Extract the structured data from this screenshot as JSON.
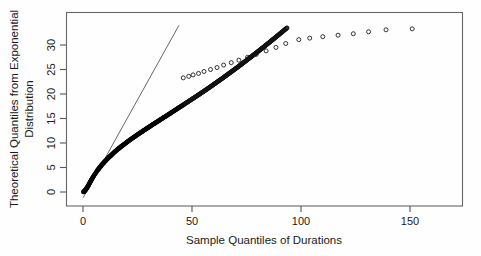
{
  "chart_data": {
    "type": "scatter",
    "title": "",
    "xlabel": "Sample Quantiles of Durations",
    "ylabel": "Theoretical Quantiles from Exponential Distribution",
    "ylabel_line1": "Theoretical Quantiles from Exponential",
    "ylabel_line2": "Distribution",
    "xlim": [
      -4,
      176
    ],
    "ylim": [
      -1.2,
      34
    ],
    "xticks": [
      0,
      50,
      100,
      150
    ],
    "yticks": [
      0,
      5,
      10,
      15,
      20,
      25,
      30
    ],
    "xtick_labels": [
      "0",
      "50",
      "100",
      "150"
    ],
    "ytick_labels": [
      "0",
      "5",
      "10",
      "15",
      "20",
      "25",
      "30"
    ],
    "grid": false,
    "legend": null,
    "point_marker": "open-circle",
    "point_color": "#111111",
    "frame_color": "#666666",
    "reference_line": {
      "label": "theoretical-exponential-reference-line",
      "color": "#555555",
      "x0": 0.0,
      "y0": -1.2,
      "x1": 44.0,
      "y1": 34.0,
      "slope": 0.8,
      "intercept": -1.2
    },
    "series": [
      {
        "name": "Sample vs theoretical exponential quantiles",
        "points": [
          [
            0.2,
            0.02
          ],
          [
            0.3,
            0.05
          ],
          [
            0.4,
            0.08
          ],
          [
            0.5,
            0.12
          ],
          [
            0.6,
            0.16
          ],
          [
            0.7,
            0.2
          ],
          [
            0.8,
            0.25
          ],
          [
            0.9,
            0.3
          ],
          [
            1.0,
            0.35
          ],
          [
            1.1,
            0.4
          ],
          [
            1.2,
            0.46
          ],
          [
            1.3,
            0.52
          ],
          [
            1.4,
            0.58
          ],
          [
            1.5,
            0.64
          ],
          [
            1.6,
            0.7
          ],
          [
            1.7,
            0.77
          ],
          [
            1.8,
            0.84
          ],
          [
            1.9,
            0.91
          ],
          [
            2.0,
            0.98
          ],
          [
            2.1,
            1.05
          ],
          [
            2.2,
            1.13
          ],
          [
            2.3,
            1.2
          ],
          [
            2.4,
            1.28
          ],
          [
            2.5,
            1.36
          ],
          [
            2.6,
            1.45
          ],
          [
            2.7,
            1.53
          ],
          [
            2.8,
            1.62
          ],
          [
            2.9,
            1.7
          ],
          [
            3.0,
            1.79
          ],
          [
            3.1,
            1.88
          ],
          [
            3.2,
            1.98
          ],
          [
            3.4,
            2.07
          ],
          [
            3.5,
            2.17
          ],
          [
            3.6,
            2.27
          ],
          [
            3.7,
            2.37
          ],
          [
            3.9,
            2.47
          ],
          [
            4.0,
            2.58
          ],
          [
            4.1,
            2.68
          ],
          [
            4.3,
            2.79
          ],
          [
            4.4,
            2.9
          ],
          [
            4.6,
            3.02
          ],
          [
            4.7,
            3.13
          ],
          [
            4.9,
            3.25
          ],
          [
            5.0,
            3.37
          ],
          [
            5.2,
            3.49
          ],
          [
            5.4,
            3.62
          ],
          [
            5.6,
            3.74
          ],
          [
            5.8,
            3.87
          ],
          [
            6.0,
            4.0
          ],
          [
            6.2,
            4.14
          ],
          [
            6.4,
            4.27
          ],
          [
            6.6,
            4.41
          ],
          [
            6.9,
            4.55
          ],
          [
            7.1,
            4.7
          ],
          [
            7.4,
            4.84
          ],
          [
            7.6,
            4.99
          ],
          [
            7.9,
            5.15
          ],
          [
            8.2,
            5.3
          ],
          [
            8.5,
            5.46
          ],
          [
            8.8,
            5.62
          ],
          [
            9.1,
            5.79
          ],
          [
            9.5,
            5.96
          ],
          [
            9.8,
            6.13
          ],
          [
            10.2,
            6.31
          ],
          [
            10.6,
            6.49
          ],
          [
            11.0,
            6.67
          ],
          [
            11.4,
            6.86
          ],
          [
            11.8,
            7.05
          ],
          [
            12.3,
            7.25
          ],
          [
            12.8,
            7.45
          ],
          [
            13.3,
            7.66
          ],
          [
            13.8,
            7.87
          ],
          [
            14.3,
            8.09
          ],
          [
            14.9,
            8.31
          ],
          [
            15.5,
            8.54
          ],
          [
            16.1,
            8.78
          ],
          [
            16.8,
            9.02
          ],
          [
            17.5,
            9.27
          ],
          [
            18.2,
            9.52
          ],
          [
            19.0,
            9.78
          ],
          [
            19.8,
            10.05
          ],
          [
            20.6,
            10.33
          ],
          [
            21.5,
            10.61
          ],
          [
            22.4,
            10.91
          ],
          [
            23.4,
            11.21
          ],
          [
            24.4,
            11.52
          ],
          [
            25.5,
            11.85
          ],
          [
            26.6,
            12.18
          ],
          [
            27.8,
            12.53
          ],
          [
            29.0,
            12.89
          ],
          [
            30.3,
            13.26
          ],
          [
            31.6,
            13.65
          ],
          [
            33.0,
            14.05
          ],
          [
            34.5,
            14.47
          ],
          [
            36.0,
            14.91
          ],
          [
            37.6,
            15.36
          ],
          [
            39.3,
            15.84
          ],
          [
            41.0,
            16.34
          ],
          [
            42.8,
            16.86
          ],
          [
            44.7,
            17.41
          ],
          [
            46.7,
            17.99
          ],
          [
            48.8,
            18.6
          ],
          [
            51.0,
            19.24
          ],
          [
            53.3,
            19.92
          ],
          [
            55.7,
            20.64
          ],
          [
            58.2,
            21.4
          ],
          [
            60.8,
            22.22
          ],
          [
            63.6,
            23.09
          ],
          [
            66.5,
            24.03
          ],
          [
            69.6,
            25.04
          ],
          [
            72.9,
            26.14
          ],
          [
            76.4,
            27.34
          ],
          [
            80.2,
            28.65
          ],
          [
            84.3,
            30.1
          ],
          [
            88.8,
            31.73
          ],
          [
            93.8,
            33.57
          ]
        ],
        "tail_points": [
          [
            46.0,
            23.3
          ],
          [
            48.5,
            23.6
          ],
          [
            50.5,
            23.9
          ],
          [
            53.0,
            24.2
          ],
          [
            55.5,
            24.6
          ],
          [
            58.5,
            25.0
          ],
          [
            61.5,
            25.4
          ],
          [
            64.5,
            25.9
          ],
          [
            68.0,
            26.4
          ],
          [
            71.5,
            26.9
          ],
          [
            75.5,
            27.5
          ],
          [
            79.5,
            28.1
          ],
          [
            84.0,
            28.8
          ],
          [
            88.5,
            29.5
          ],
          [
            93.0,
            30.3
          ],
          [
            99.0,
            31.1
          ],
          [
            104.0,
            31.4
          ],
          [
            110.0,
            31.7
          ],
          [
            117.0,
            32.0
          ],
          [
            124.0,
            32.3
          ],
          [
            131.0,
            32.7
          ],
          [
            139.0,
            33.1
          ],
          [
            151.0,
            33.3
          ],
          [
            175.0,
            34.0
          ]
        ]
      }
    ]
  }
}
